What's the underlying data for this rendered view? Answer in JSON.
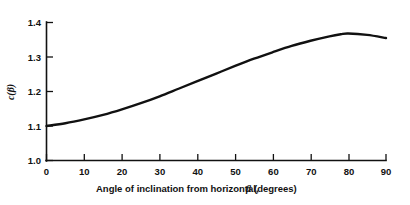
{
  "chart_data": {
    "type": "line",
    "title": "",
    "subtitle": "",
    "xlabel": "Angle of inclination from horizontal, β (degrees)",
    "xlabel_parts": {
      "before": "Angle of inclination from horizontal,",
      "symbol": "β",
      "after": "(degrees)"
    },
    "ylabel": "c(β)",
    "ylabel_parts": {
      "before": "c(",
      "symbol": "β",
      "after": ")"
    },
    "xlim": [
      0,
      90
    ],
    "ylim": [
      1.0,
      1.4
    ],
    "xticks": [
      0,
      10,
      20,
      30,
      40,
      50,
      60,
      70,
      80,
      90
    ],
    "xticklabels": [
      "0",
      "10",
      "20",
      "30",
      "40",
      "50",
      "60",
      "70",
      "80",
      "90"
    ],
    "yticks": [
      1.0,
      1.1,
      1.2,
      1.3,
      1.4
    ],
    "yticklabels": [
      "1.0",
      "1.1",
      "1.2",
      "1.3",
      "1.4"
    ],
    "grid": false,
    "legend": null,
    "legend_position": "none",
    "tick_direction": "in",
    "spines": [
      "left",
      "bottom"
    ],
    "line_color": "#111111",
    "background_color": "#ffffff",
    "series": [
      {
        "name": "c(β)",
        "x": [
          0,
          5,
          10,
          15,
          20,
          25,
          30,
          35,
          40,
          45,
          50,
          55,
          60,
          65,
          70,
          75,
          78,
          80,
          85,
          90
        ],
        "values": [
          1.1,
          1.108,
          1.119,
          1.132,
          1.148,
          1.166,
          1.186,
          1.208,
          1.23,
          1.252,
          1.274,
          1.295,
          1.314,
          1.332,
          1.347,
          1.36,
          1.366,
          1.368,
          1.364,
          1.355
        ]
      }
    ],
    "annotations": []
  }
}
